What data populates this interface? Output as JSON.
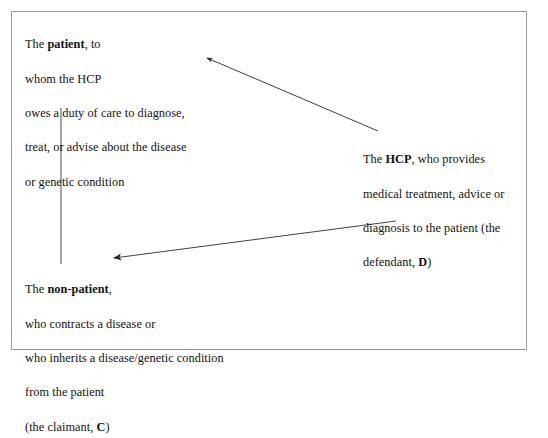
{
  "figure": {
    "border_color": "#9a9a9a",
    "background": "#ffffff",
    "text_color": "#121212",
    "line_color": "#2b2b2b"
  },
  "blocks": {
    "patient": {
      "name": "patient-node",
      "lines": [
        {
          "pre": "The ",
          "bold": "patient",
          "post": ", to"
        },
        {
          "pre": "whom the HCP",
          "bold": "",
          "post": ""
        },
        {
          "pre": "owes a duty of care to diagnose,",
          "bold": "",
          "post": ""
        },
        {
          "pre": "treat, or advise about the disease",
          "bold": "",
          "post": ""
        },
        {
          "pre": "or genetic condition",
          "bold": "",
          "post": ""
        }
      ],
      "plain_text": "The patient, to whom the HCP owes a duty of care to diagnose, treat, or advise about the disease or genetic condition"
    },
    "hcp": {
      "name": "hcp-node",
      "lines": [
        {
          "pre": "The ",
          "bold": "HCP",
          "post": ", who provides"
        },
        {
          "pre": "medical treatment, advice or",
          "bold": "",
          "post": ""
        },
        {
          "pre": "diagnosis to the patient (the",
          "bold": "",
          "post": ""
        },
        {
          "pre": "defendant, ",
          "bold": "D",
          "post": ")"
        }
      ],
      "plain_text": "The HCP, who provides medical treatment, advice or diagnosis to the patient (the defendant, D)"
    },
    "non_patient": {
      "name": "non-patient-node",
      "lines": [
        {
          "pre": "The ",
          "bold": "non-patient",
          "post": ","
        },
        {
          "pre": "who contracts a disease or",
          "bold": "",
          "post": ""
        },
        {
          "pre": "who inherits a disease/genetic condition",
          "bold": "",
          "post": ""
        },
        {
          "pre": "from the patient",
          "bold": "",
          "post": ""
        },
        {
          "pre": "(the claimant, ",
          "bold": "C",
          "post": ")"
        }
      ],
      "plain_text": "The non-patient, who contracts a disease or who inherits a disease/genetic condition from the patient (the claimant, C)"
    }
  },
  "connectors": [
    {
      "name": "connector-hcp-to-patient",
      "from": "hcp",
      "to": "patient",
      "arrowhead": "at-patient-end",
      "x1": 378,
      "y1": 131,
      "x2": 206,
      "y2": 58
    },
    {
      "name": "connector-hcp-to-non-patient",
      "from": "hcp",
      "to": "non_patient",
      "arrowhead": "at-non-patient-end",
      "x1": 396,
      "y1": 221,
      "x2": 111,
      "y2": 259
    },
    {
      "name": "connector-patient-to-non-patient",
      "from": "patient",
      "to": "non_patient",
      "arrowhead": "none",
      "x1": 61,
      "y1": 108,
      "x2": 61,
      "y2": 264
    }
  ]
}
